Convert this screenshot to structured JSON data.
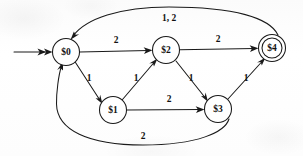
{
  "diagram": {
    "type": "state-machine",
    "background_color": "#fdfdfd",
    "stroke_color": "#1a1a1a",
    "nodes": [
      {
        "id": "s0",
        "label": "$0",
        "x": 66,
        "y": 52,
        "r": 13.5,
        "accepting": false,
        "start": true
      },
      {
        "id": "s1",
        "label": "$1",
        "x": 113,
        "y": 110,
        "r": 13.5,
        "accepting": false,
        "start": false
      },
      {
        "id": "s2",
        "label": "$2",
        "x": 166,
        "y": 50,
        "r": 13.5,
        "accepting": false,
        "start": false
      },
      {
        "id": "s3",
        "label": "$3",
        "x": 218,
        "y": 109,
        "r": 13.5,
        "accepting": false,
        "start": false
      },
      {
        "id": "s4",
        "label": "$4",
        "x": 272,
        "y": 48,
        "r": 13.5,
        "accepting": true,
        "start": false
      }
    ],
    "edges": [
      {
        "id": "e-start",
        "from": "",
        "to": "s0",
        "label": "",
        "label_x": 0,
        "label_y": 0
      },
      {
        "id": "e-s0-s2",
        "from": "s0",
        "to": "s2",
        "label": "2",
        "label_x": 116,
        "label_y": 41
      },
      {
        "id": "e-s2-s4",
        "from": "s2",
        "to": "s4",
        "label": "2",
        "label_x": 218,
        "label_y": 40
      },
      {
        "id": "e-s4-s0",
        "from": "s4",
        "to": "s0",
        "label": "1, 2",
        "label_x": 169,
        "label_y": 19
      },
      {
        "id": "e-s0-s1",
        "from": "s0",
        "to": "s1",
        "label": "1",
        "label_x": 89,
        "label_y": 79
      },
      {
        "id": "e-s1-s2",
        "from": "s1",
        "to": "s2",
        "label": "1",
        "label_x": 136,
        "label_y": 79
      },
      {
        "id": "e-s2-s3",
        "from": "s2",
        "to": "s3",
        "label": "1",
        "label_x": 191,
        "label_y": 79
      },
      {
        "id": "e-s1-s3",
        "from": "s1",
        "to": "s3",
        "label": "2",
        "label_x": 169,
        "label_y": 100
      },
      {
        "id": "e-s3-s4",
        "from": "s3",
        "to": "s4",
        "label": "1",
        "label_x": 246,
        "label_y": 79
      },
      {
        "id": "e-s3-s0",
        "from": "s3",
        "to": "s0",
        "label": "2",
        "label_x": 143,
        "label_y": 137
      }
    ]
  }
}
